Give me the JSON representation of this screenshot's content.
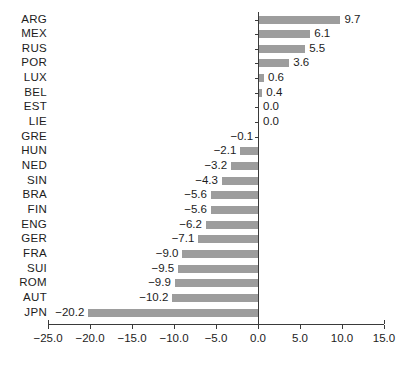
{
  "chart_data": {
    "type": "bar",
    "orientation": "horizontal",
    "title": "",
    "subtitle": "",
    "xlabel": "",
    "ylabel": "",
    "xlim": [
      -25.0,
      15.0
    ],
    "xticks": [
      -25.0,
      -20.0,
      -15.0,
      -10.0,
      -5.0,
      0.0,
      5.0,
      10.0,
      15.0
    ],
    "xtick_labels": [
      "−25.0",
      "−20.0",
      "−15.0",
      "−10.0",
      "−5.0",
      "0.0",
      "5.0",
      "10.0",
      "15.0"
    ],
    "grid": false,
    "legend": null,
    "bar_color": "#9d9d9d",
    "axis_color": "#3a3a3a",
    "categories": [
      "ARG",
      "MEX",
      "RUS",
      "POR",
      "LUX",
      "BEL",
      "EST",
      "LIE",
      "GRE",
      "HUN",
      "NED",
      "SIN",
      "BRA",
      "FIN",
      "ENG",
      "GER",
      "FRA",
      "SUI",
      "ROM",
      "AUT",
      "JPN"
    ],
    "values": [
      9.7,
      6.1,
      5.5,
      3.6,
      0.6,
      0.4,
      0.0,
      0.0,
      -0.1,
      -2.1,
      -3.2,
      -4.3,
      -5.6,
      -5.6,
      -6.2,
      -7.1,
      -9.0,
      -9.5,
      -9.9,
      -10.2,
      -20.2
    ],
    "value_labels": [
      "9.7",
      "6.1",
      "5.5",
      "3.6",
      "0.6",
      "0.4",
      "0.0",
      "0.0",
      "−0.1",
      "−2.1",
      "−3.2",
      "−4.3",
      "−5.6",
      "−5.6",
      "−6.2",
      "−7.1",
      "−9.0",
      "−9.5",
      "−9.9",
      "−10.2",
      "−20.2"
    ]
  }
}
